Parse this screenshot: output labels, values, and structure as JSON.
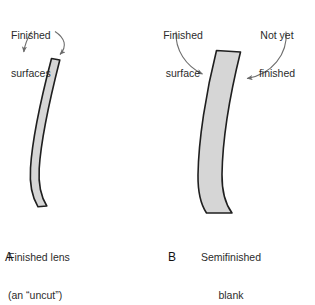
{
  "figure": {
    "background_color": "#ffffff",
    "lens_fill_color": "#d6d6d6",
    "lens_stroke_color": "#1f1f1f",
    "arrow_color": "#6e6e6e",
    "text_color": "#2b2b2b"
  },
  "panel_a": {
    "letter": "A",
    "caption_line1": "Finished lens",
    "caption_line2": "(an “uncut”)",
    "annotation": {
      "line1": "Finished",
      "line2": "surfaces"
    },
    "arrows": [
      {
        "name": "arrow-to-front-surface",
        "points_to": "front surface of finished lens"
      },
      {
        "name": "arrow-to-back-surface",
        "points_to": "back surface of finished lens"
      }
    ]
  },
  "panel_b": {
    "letter": "B",
    "caption_line1": "Semifinished",
    "caption_line2": "blank",
    "annotation_left": {
      "line1": "Finished",
      "line2": "surface"
    },
    "annotation_right": {
      "line1": "Not yet",
      "line2": "finished"
    },
    "arrows": [
      {
        "name": "arrow-to-finished-surface",
        "points_to": "concave finished surface of blank"
      },
      {
        "name": "arrow-to-unfinished-surface",
        "points_to": "convex unfinished surface of blank"
      }
    ]
  }
}
